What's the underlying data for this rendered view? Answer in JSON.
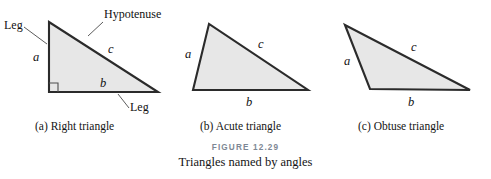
{
  "figure": {
    "number_label": "Figure 12.29",
    "title": "Triangles named by angles",
    "background_color": "#ffffff",
    "triangle_fill_color": "#e7e7e7",
    "triangle_stroke_color": "#2b2b2b",
    "figure_number_color": "#7d8894"
  },
  "panels": [
    {
      "caption": "(a)  Right triangle",
      "side_labels": {
        "leg_vertical": "a",
        "leg_horizontal": "b",
        "hypotenuse": "c"
      },
      "callouts": [
        {
          "name": "hypotenuse",
          "text": "Hypotenuse"
        },
        {
          "name": "leg-upper-left",
          "text": "Leg"
        },
        {
          "name": "leg-lower-right",
          "text": "Leg"
        }
      ],
      "has_right_angle_marker": true
    },
    {
      "caption": "(b)  Acute triangle",
      "side_labels": {
        "left_side": "a",
        "base": "b",
        "upper_side": "c"
      },
      "callouts": [],
      "has_right_angle_marker": false
    },
    {
      "caption": "(c)  Obtuse triangle",
      "side_labels": {
        "left_side": "a",
        "base": "b",
        "upper_side": "c"
      },
      "callouts": [],
      "has_right_angle_marker": false
    }
  ]
}
